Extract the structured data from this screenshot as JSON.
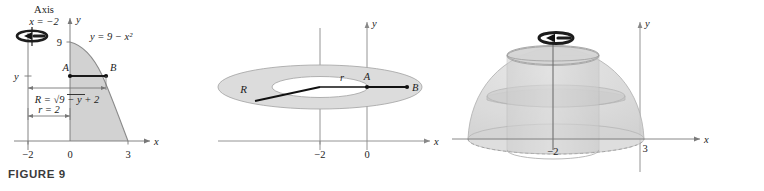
{
  "figure": {
    "caption": "FIGURE 9"
  },
  "colors": {
    "region_fill": "#d2d2d2",
    "region_stroke": "#8a8a8a",
    "axis": "#6e6e6e",
    "text": "#232323",
    "solid_fill": "#d8d8d8",
    "solid_stroke": "#a8a8a8",
    "washer_fill": "#dcdcdc",
    "accent": "#1a1a1a"
  },
  "panels": [
    {
      "id": "region-panel",
      "name": "plane-region",
      "axis_note": {
        "title": "Axis",
        "equation": "x = −2"
      },
      "curve_label": "y = 9 − x²",
      "radius_label": "R = √9 − y + 2",
      "inner_radius_label": "r = 2",
      "y_tick_label": "y",
      "y_value_label": "9",
      "point_labels": [
        "A",
        "B"
      ],
      "x_axis_label": "x",
      "y_axis_label": "y",
      "x_ticks": [
        "−2",
        "0",
        "3"
      ],
      "rotation_icon": "rotation-arrow-icon"
    },
    {
      "id": "washer-panel",
      "name": "washer-cross-section",
      "outer_radius_label": "R",
      "inner_radius_label": "r",
      "point_labels": [
        "A",
        "B"
      ],
      "x_axis_label": "x",
      "y_axis_label": "y",
      "x_ticks": [
        "−2",
        "0"
      ]
    },
    {
      "id": "solid-panel",
      "name": "solid-of-revolution",
      "x_axis_label": "x",
      "y_axis_label": "y",
      "x_ticks": [
        "−2",
        "3"
      ],
      "rotation_icon": "rotation-arrow-icon"
    }
  ]
}
